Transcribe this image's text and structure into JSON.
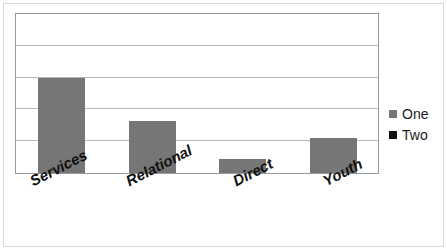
{
  "chart_data": {
    "type": "bar",
    "title": "",
    "subtitle": "",
    "xlabel": "",
    "ylabel": "",
    "categories": [
      "Services",
      "Relational",
      "Direct",
      "Youth"
    ],
    "series": [
      {
        "name": "One",
        "color": "#767676",
        "values": [
          3.0,
          1.65,
          0.45,
          1.1
        ]
      },
      {
        "name": "Two",
        "color": "#111111",
        "values": [
          0,
          0,
          0,
          0
        ]
      }
    ],
    "ylim": [
      0,
      5
    ],
    "yticks": [
      0,
      1,
      2,
      3,
      4,
      5
    ],
    "ytick_labels": [
      "",
      "",
      "",
      "",
      "",
      ""
    ],
    "grid": true,
    "grid_horizontal": true,
    "grid_vertical": false,
    "legend_position": "right",
    "legend": [
      {
        "label": "One",
        "swatch_color": "#767676"
      },
      {
        "label": "Two",
        "swatch_color": "#111111"
      }
    ]
  },
  "colors": {
    "bar_gray": "#767676",
    "bar_black": "#111111",
    "gridline": "#b8b8b8",
    "plot_border": "#9a9a9a",
    "outer_border": "#d8d8d8",
    "background": "#ffffff"
  },
  "axis": {
    "categories": [
      {
        "label": "Services"
      },
      {
        "label": "Relational"
      },
      {
        "label": "Direct"
      },
      {
        "label": "Youth"
      }
    ]
  }
}
